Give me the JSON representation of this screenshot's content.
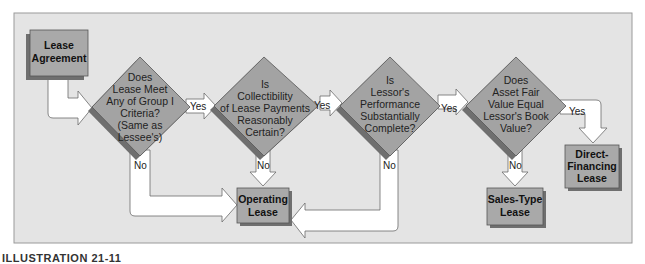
{
  "figure": {
    "caption": "ILLUSTRATION 21-11",
    "colors": {
      "panel": "#e4e4e4",
      "panel_border": "#9a9a9a",
      "diamond": "#a3a3a3",
      "box": "#a9a9a9",
      "arrow_fill": "#ffffff",
      "arrow_stroke": "#6a6a6a",
      "shadow": "#6f6f6f"
    }
  },
  "nodes": {
    "start": {
      "line1": "Lease",
      "line2": "Agreement"
    },
    "decision1": {
      "lines": [
        "Does",
        "Lease Meet",
        "Any of Group I",
        "Criteria?",
        "(Same as",
        "Lessee's)"
      ]
    },
    "decision2": {
      "lines": [
        "Is",
        "Collectibility",
        "of Lease Payments",
        "Reasonably",
        "Certain?"
      ]
    },
    "decision3": {
      "lines": [
        "Is",
        "Lessor's",
        "Performance",
        "Substantially",
        "Complete?"
      ]
    },
    "decision4": {
      "lines": [
        "Does",
        "Asset Fair",
        "Value Equal",
        "Lessor's Book",
        "Value?"
      ]
    },
    "operating": {
      "line1": "Operating",
      "line2": "Lease"
    },
    "sales_type": {
      "line1": "Sales-Type",
      "line2": "Lease"
    },
    "direct_financing": {
      "line1": "Direct-",
      "line2": "Financing",
      "line3": "Lease"
    }
  },
  "edges": {
    "d1_yes": "Yes",
    "d1_no": "No",
    "d2_yes": "Yes",
    "d2_no": "No",
    "d3_yes": "Yes",
    "d3_no": "No",
    "d4_yes": "Yes",
    "d4_no": "No"
  }
}
